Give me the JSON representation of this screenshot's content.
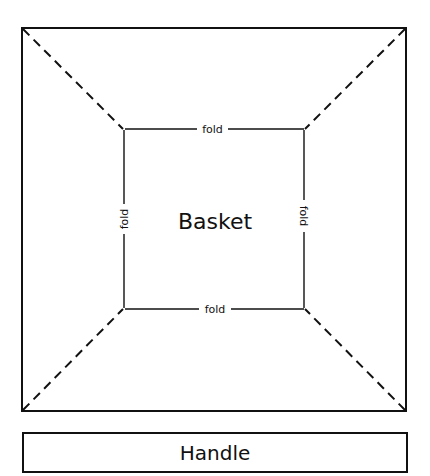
{
  "diagram": {
    "type": "paper-craft template",
    "basket": {
      "label": "Basket",
      "fold_labels": {
        "top": "fold",
        "bottom": "fold",
        "left": "fold",
        "right": "fold"
      },
      "outer_square": {
        "x1": 22,
        "y1": 28,
        "x2": 406,
        "y2": 411
      },
      "inner_square": {
        "x1": 123,
        "y1": 129,
        "x2": 305,
        "y2": 309
      },
      "cut_lines": "dashed diagonals from outer corners to inner corners"
    },
    "handle": {
      "label": "Handle",
      "box": {
        "x1": 23,
        "y1": 433,
        "x2": 407,
        "y2": 472
      }
    },
    "colors": {
      "line": "#111111",
      "background": "#ffffff"
    }
  }
}
